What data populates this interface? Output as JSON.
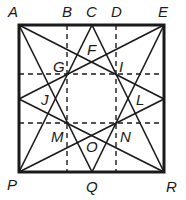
{
  "diagram": {
    "square": {
      "x1": 19,
      "y1": 25,
      "x2": 164,
      "y2": 172
    },
    "points": {
      "A": [
        19,
        25
      ],
      "E": [
        164,
        25
      ],
      "P": [
        19,
        172
      ],
      "R": [
        164,
        172
      ],
      "C": [
        92,
        25
      ],
      "Q": [
        92,
        172
      ],
      "LM": [
        19,
        99
      ],
      "RM": [
        164,
        99
      ]
    },
    "dashed_lines": [
      {
        "name": "vertical-B",
        "x1": 67,
        "y1": 25,
        "x2": 67,
        "y2": 172
      },
      {
        "name": "vertical-D",
        "x1": 116,
        "y1": 25,
        "x2": 116,
        "y2": 172
      },
      {
        "name": "horizontal-upper",
        "x1": 19,
        "y1": 74,
        "x2": 164,
        "y2": 74
      },
      {
        "name": "horizontal-lower",
        "x1": 19,
        "y1": 123,
        "x2": 164,
        "y2": 123
      }
    ],
    "star_lines": [
      {
        "from": "C",
        "to": "P"
      },
      {
        "from": "C",
        "to": "R"
      },
      {
        "from": "Q",
        "to": "A"
      },
      {
        "from": "Q",
        "to": "E"
      },
      {
        "from": "LM",
        "to": "E"
      },
      {
        "from": "LM",
        "to": "R"
      },
      {
        "from": "RM",
        "to": "A"
      },
      {
        "from": "RM",
        "to": "P"
      }
    ],
    "labels": [
      {
        "text": "A",
        "x": 8,
        "y": 17
      },
      {
        "text": "B",
        "x": 62,
        "y": 17
      },
      {
        "text": "C",
        "x": 86,
        "y": 17
      },
      {
        "text": "D",
        "x": 111,
        "y": 17
      },
      {
        "text": "E",
        "x": 158,
        "y": 17
      },
      {
        "text": "F",
        "x": 87,
        "y": 55
      },
      {
        "text": "G",
        "x": 53,
        "y": 72
      },
      {
        "text": "I",
        "x": 119,
        "y": 72
      },
      {
        "text": "J",
        "x": 41,
        "y": 105
      },
      {
        "text": "L",
        "x": 136,
        "y": 105
      },
      {
        "text": "M",
        "x": 51,
        "y": 142
      },
      {
        "text": "N",
        "x": 120,
        "y": 142
      },
      {
        "text": "O",
        "x": 86,
        "y": 152
      },
      {
        "text": "P",
        "x": 7,
        "y": 190
      },
      {
        "text": "Q",
        "x": 86,
        "y": 192
      },
      {
        "text": "R",
        "x": 166,
        "y": 192
      }
    ]
  }
}
